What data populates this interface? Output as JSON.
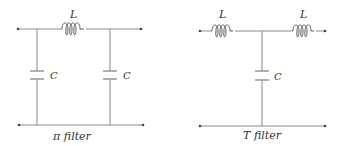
{
  "diagram": {
    "pi_filter": {
      "caption": "π filter",
      "inductor_label": "L",
      "capacitor_left_label": "C",
      "capacitor_right_label": "C"
    },
    "t_filter": {
      "caption": "T filter",
      "inductor_left_label": "L",
      "inductor_right_label": "L",
      "capacitor_label": "C"
    },
    "colors": {
      "wire": "#8a8a8a",
      "component": "#5a5a5a",
      "text": "#333333",
      "background": "#ffffff"
    }
  }
}
